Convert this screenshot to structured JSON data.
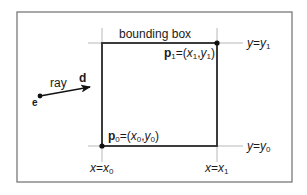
{
  "diagram": {
    "title": "bounding box",
    "colors": {
      "frame": "#6e6e6e",
      "box": "#2a2a2a",
      "guide": "#b8b8b8",
      "point": "#111111",
      "text": "#1a1a1a",
      "background": "#ffffff"
    },
    "frame": {
      "x": 17,
      "y": 12,
      "w": 275,
      "h": 170
    },
    "box": {
      "x0": 102,
      "y0": 146,
      "x1": 217,
      "y1": 43
    },
    "ray": {
      "label": "ray",
      "direction_label": "d",
      "origin_label": "e",
      "origin": {
        "x": 40,
        "y": 96
      },
      "tip": {
        "x": 91,
        "y": 87
      }
    },
    "points": {
      "p0": {
        "name": "p",
        "sub": "0",
        "eq": "=(",
        "xname": "x",
        "xsub": "0",
        "comma": ",",
        "yname": "y",
        "ysub": "0",
        "close": ")"
      },
      "p1": {
        "name": "p",
        "sub": "1",
        "eq": "=(",
        "xname": "x",
        "xsub": "1",
        "comma": ",",
        "yname": "y",
        "ysub": "1",
        "close": ")"
      }
    },
    "guides": {
      "y_top": {
        "lhs": "y",
        "eq": "=",
        "rhs": "y",
        "sub": "1"
      },
      "y_bottom": {
        "lhs": "y",
        "eq": "=",
        "rhs": "y",
        "sub": "0"
      },
      "x_left": {
        "lhs": "x",
        "eq": "=",
        "rhs": "x",
        "sub": "0"
      },
      "x_right": {
        "lhs": "x",
        "eq": "=",
        "rhs": "x",
        "sub": "1"
      }
    }
  }
}
